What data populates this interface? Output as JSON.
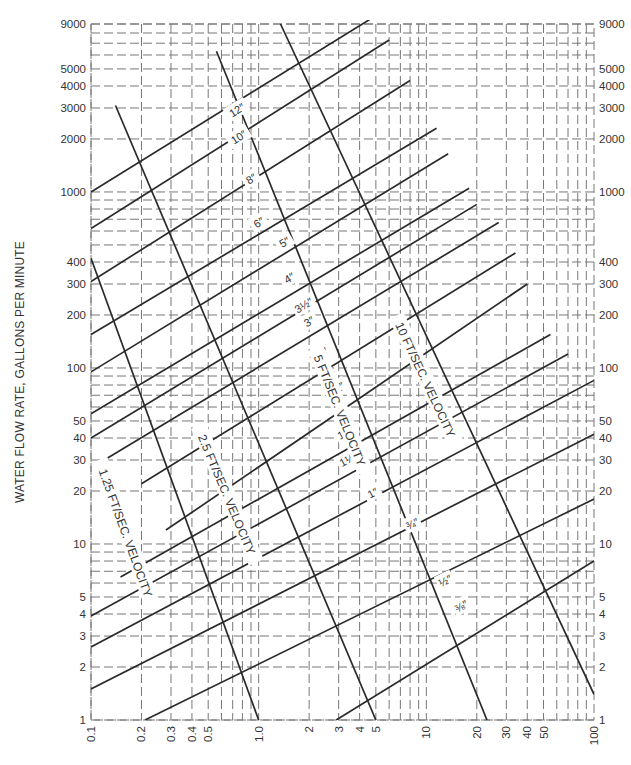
{
  "chart_data": {
    "type": "line",
    "title": "",
    "xlabel": "",
    "ylabel": "WATER FLOW RATE, GALLONS PER MINUTE",
    "x_scale": "log",
    "y_scale": "log",
    "xlim": [
      0.1,
      100
    ],
    "ylim": [
      1,
      9000
    ],
    "grid": true,
    "grid_style": "dashed",
    "x_ticks": [
      "0.1",
      "0.2",
      "0.3",
      "0.4",
      "0.5",
      "1.0",
      "2",
      "3",
      "4",
      "5",
      "10",
      "20",
      "30",
      "40",
      "50",
      "100"
    ],
    "x_tick_values": [
      0.1,
      0.2,
      0.3,
      0.4,
      0.5,
      1.0,
      2,
      3,
      4,
      5,
      10,
      20,
      30,
      40,
      50,
      100
    ],
    "y_ticks_left": [
      "9000",
      "5000",
      "4000",
      "3000",
      "2000",
      "1000",
      "400",
      "300",
      "200",
      "100",
      "50",
      "40",
      "30",
      "20",
      "10",
      "5",
      "4",
      "3",
      "2",
      "1"
    ],
    "y_ticks_right": [
      "9000",
      "5000",
      "4000",
      "3000",
      "2000",
      "1000",
      "400",
      "300",
      "200",
      "100",
      "50",
      "40",
      "30",
      "20",
      "10",
      "5",
      "4",
      "3",
      "2",
      "1"
    ],
    "y_tick_values": [
      9000,
      5000,
      4000,
      3000,
      2000,
      1000,
      400,
      300,
      200,
      100,
      50,
      40,
      30,
      20,
      10,
      5,
      4,
      3,
      2,
      1
    ],
    "pipe_series": [
      {
        "name": "12″",
        "label": "12″",
        "x": [
          0.1,
          4.8
        ],
        "y": [
          1000,
          9800
        ],
        "label_at": [
          0.78,
          2700
        ]
      },
      {
        "name": "10″",
        "label": "10″",
        "x": [
          0.1,
          6.0
        ],
        "y": [
          620,
          7300
        ],
        "label_at": [
          0.8,
          1900
        ]
      },
      {
        "name": "8″",
        "label": "8″",
        "x": [
          0.1,
          8.0
        ],
        "y": [
          310,
          4300
        ],
        "label_at": [
          0.95,
          1100
        ]
      },
      {
        "name": "6″",
        "label": "6″",
        "x": [
          0.1,
          11.5
        ],
        "y": [
          155,
          2300
        ],
        "label_at": [
          1.05,
          620
        ]
      },
      {
        "name": "5″",
        "label": "5″",
        "x": [
          0.1,
          13.5
        ],
        "y": [
          95,
          1650
        ],
        "label_at": [
          1.5,
          480
        ]
      },
      {
        "name": "4″",
        "label": "4″",
        "x": [
          0.1,
          18.0
        ],
        "y": [
          55,
          1050
        ],
        "label_at": [
          1.6,
          300
        ]
      },
      {
        "name": "3½″",
        "label": "3½″",
        "x": [
          0.1,
          20.0
        ],
        "y": [
          40,
          850
        ],
        "label_at": [
          1.95,
          210
        ]
      },
      {
        "name": "3″",
        "label": "3″",
        "x": [
          0.12,
          27.0
        ],
        "y": [
          30,
          670
        ],
        "label_at": [
          2.1,
          170
        ]
      },
      {
        "name": "2½″",
        "label": "2½″",
        "x": [
          0.2,
          34.0
        ],
        "y": [
          22,
          450
        ],
        "label_at": [
          2.4,
          110
        ]
      },
      {
        "name": "2″",
        "label": "2″",
        "x": [
          0.28,
          40.0
        ],
        "y": [
          12,
          300
        ],
        "label_at": [
          3.2,
          72
        ]
      },
      {
        "name": "1½″",
        "label": "1½″",
        "x": [
          0.15,
          55.0
        ],
        "y": [
          6.5,
          155
        ],
        "label_at": [
          3.5,
          40
        ]
      },
      {
        "name": "1¼″",
        "label": "1¼″",
        "x": [
          0.1,
          70.0
        ],
        "y": [
          3.9,
          120
        ],
        "label_at": [
          3.6,
          28
        ]
      },
      {
        "name": "1″",
        "label": "1″",
        "x": [
          0.1,
          100.0
        ],
        "y": [
          2.6,
          85
        ],
        "label_at": [
          5.0,
          18
        ]
      },
      {
        "name": "¾″",
        "label": "¾″",
        "x": [
          0.1,
          100.0
        ],
        "y": [
          1.5,
          42
        ],
        "label_at": [
          8.6,
          12
        ]
      },
      {
        "name": "½″",
        "label": "½″",
        "x": [
          0.21,
          100.0
        ],
        "y": [
          1,
          18
        ],
        "label_at": [
          13.5,
          5.7
        ]
      },
      {
        "name": "⅜″",
        "label": "⅜″",
        "x": [
          2.9,
          100.0
        ],
        "y": [
          1,
          8
        ],
        "label_at": [
          17.0,
          4.1
        ]
      }
    ],
    "velocity_series": [
      {
        "name": "1.25 FT/SEC. VELOCITY",
        "label": "1.25 FT/SEC. VELOCITY",
        "x": [
          0.1,
          1.0
        ],
        "y": [
          420,
          1
        ],
        "label_at": [
          0.18,
          12
        ]
      },
      {
        "name": "2.5 FT/SEC. VELOCITY",
        "label": "2.5 FT/SEC. VELOCITY",
        "x": [
          0.14,
          5.0
        ],
        "y": [
          3100,
          1
        ],
        "label_at": [
          0.72,
          20
        ]
      },
      {
        "name": "5 FT/SEC. VELOCITY",
        "label": "5 FT/SEC. VELOCITY",
        "x": [
          0.56,
          23.0
        ],
        "y": [
          6300,
          1
        ],
        "label_at": [
          3.4,
          60
        ]
      },
      {
        "name": "10 FT/SEC. VELOCITY",
        "label": "10 FT/SEC. VELOCITY",
        "x": [
          1.35,
          100.0
        ],
        "y": [
          9000,
          1.4
        ],
        "label_at": [
          11.0,
          90
        ]
      }
    ],
    "legend": null
  }
}
